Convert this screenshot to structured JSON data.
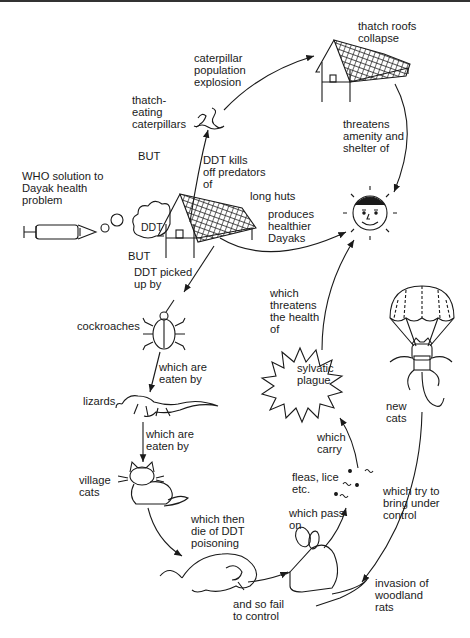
{
  "diagram": {
    "colors": {
      "ink": "#1a1a1a",
      "background": "#ffffff"
    },
    "nodes": [
      {
        "id": "who",
        "label": "WHO solution to\nDayak health\nproblem",
        "icon": "syringe-icon"
      },
      {
        "id": "ddt",
        "label": "DDT",
        "icon": "ddt-cloud-icon"
      },
      {
        "id": "huts",
        "label": "long huts",
        "icon": "long-hut-icon"
      },
      {
        "id": "caterpillars",
        "label": "thatch-\neating\ncaterpillars",
        "icon": "caterpillar-icon"
      },
      {
        "id": "explosion",
        "label": "caterpillar\npopulation\nexplosion"
      },
      {
        "id": "roofs",
        "label": "thatch roofs\ncollapse",
        "icon": "collapsed-hut-icon"
      },
      {
        "id": "dayak",
        "label": "",
        "icon": "smiling-face-icon"
      },
      {
        "id": "cockroaches",
        "label": "cockroaches",
        "icon": "cockroach-icon"
      },
      {
        "id": "lizards",
        "label": "lizards",
        "icon": "lizard-icon"
      },
      {
        "id": "cats",
        "label": "village\ncats",
        "icon": "cat-icon"
      },
      {
        "id": "deadcat",
        "label": "",
        "icon": "dead-cat-icon"
      },
      {
        "id": "rats",
        "label": "invasion of\nwoodland\nrats",
        "icon": "rat-icon"
      },
      {
        "id": "fleas",
        "label": "fleas, lice\netc.",
        "icon": "fleas-icon"
      },
      {
        "id": "plague",
        "label": "sylvatic\nplague",
        "icon": "plague-burst-icon"
      },
      {
        "id": "newcats",
        "label": "new\ncats",
        "icon": "parachute-cat-icon"
      }
    ],
    "edges": {
      "but_top": "BUT",
      "kills_predators": "DDT kills\noff predators\nof",
      "threatens_shelter": "threatens\namenity and\nshelter of",
      "produces": "produces\nhealthier\nDayaks",
      "but_bottom": "BUT",
      "picked_up": "DDT picked\nup by",
      "eaten1": "which are\neaten by",
      "eaten2": "which are\neaten by",
      "die": "which then\ndie of DDT\npoisoning",
      "fail": "and so fail\nto control",
      "pass_on": "which pass\non",
      "carry": "which\ncarry",
      "threatens_health": "which\nthreatens\nthe health\nof",
      "bring_control": "which try to\nbring under\ncontrol"
    }
  }
}
